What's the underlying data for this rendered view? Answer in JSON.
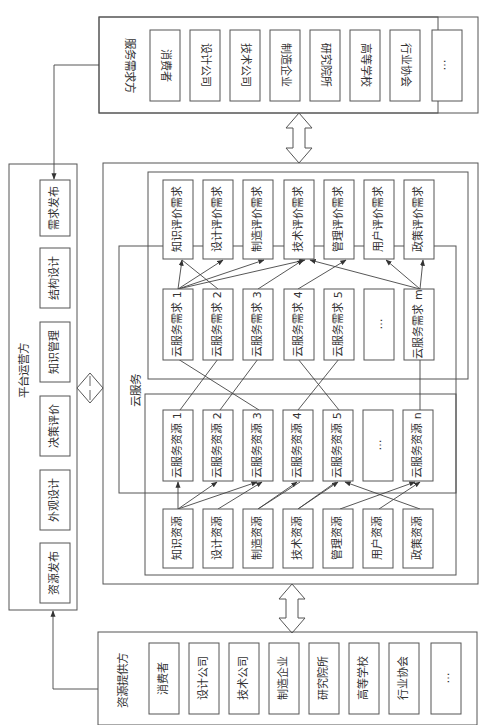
{
  "service_demanders": {
    "title": "服务需求方",
    "items": [
      "消费者",
      "设计公司",
      "技术公司",
      "制造企业",
      "研究院所",
      "高等学校",
      "行业协会",
      "…"
    ]
  },
  "resource_providers": {
    "title": "资源提供方",
    "items": [
      "消费者",
      "设计公司",
      "技术公司",
      "制造企业",
      "研究院所",
      "高等学校",
      "行业协会",
      "…"
    ]
  },
  "platform_operator": {
    "title": "平台运营方",
    "items": [
      "需求发布",
      "结构设计",
      "知识管理",
      "决策评价",
      "外观设计",
      "资源发布"
    ]
  },
  "cloud_service": {
    "title": "云服务",
    "evaluation_demands": [
      "知识评价需求",
      "设计评价需求",
      "制造评价需求",
      "技术评价需求",
      "管理评价需求",
      "用户评价需求",
      "政策评价需求"
    ],
    "cloud_demands": [
      "云服务需求 1",
      "云服务需求 2",
      "云服务需求 3",
      "云服务需求 4",
      "云服务需求 5",
      "…",
      "云服务需求 m"
    ],
    "cloud_resources": [
      "云服务资源 1",
      "云服务资源 2",
      "云服务资源 3",
      "云服务资源 4",
      "云服务资源 5",
      "…",
      "云服务资源 n"
    ],
    "base_resources": [
      "知识资源",
      "设计资源",
      "制造资源",
      "技术资源",
      "管理资源",
      "用户资源",
      "政策资源"
    ]
  },
  "colors": {
    "stroke": "#555555",
    "text": "#333333",
    "background": "#ffffff"
  }
}
